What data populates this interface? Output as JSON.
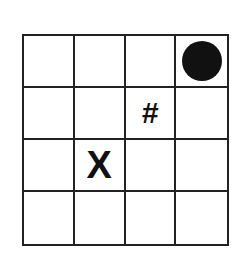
{
  "board": {
    "rows": 4,
    "cols": 4,
    "cells": [
      [
        "",
        "",
        "",
        "circle"
      ],
      [
        "",
        "",
        "#",
        ""
      ],
      [
        "",
        "X",
        "",
        ""
      ],
      [
        "",
        "",
        "",
        ""
      ]
    ],
    "symbols": {
      "circle": "",
      "hash": "#",
      "x": "X"
    }
  }
}
